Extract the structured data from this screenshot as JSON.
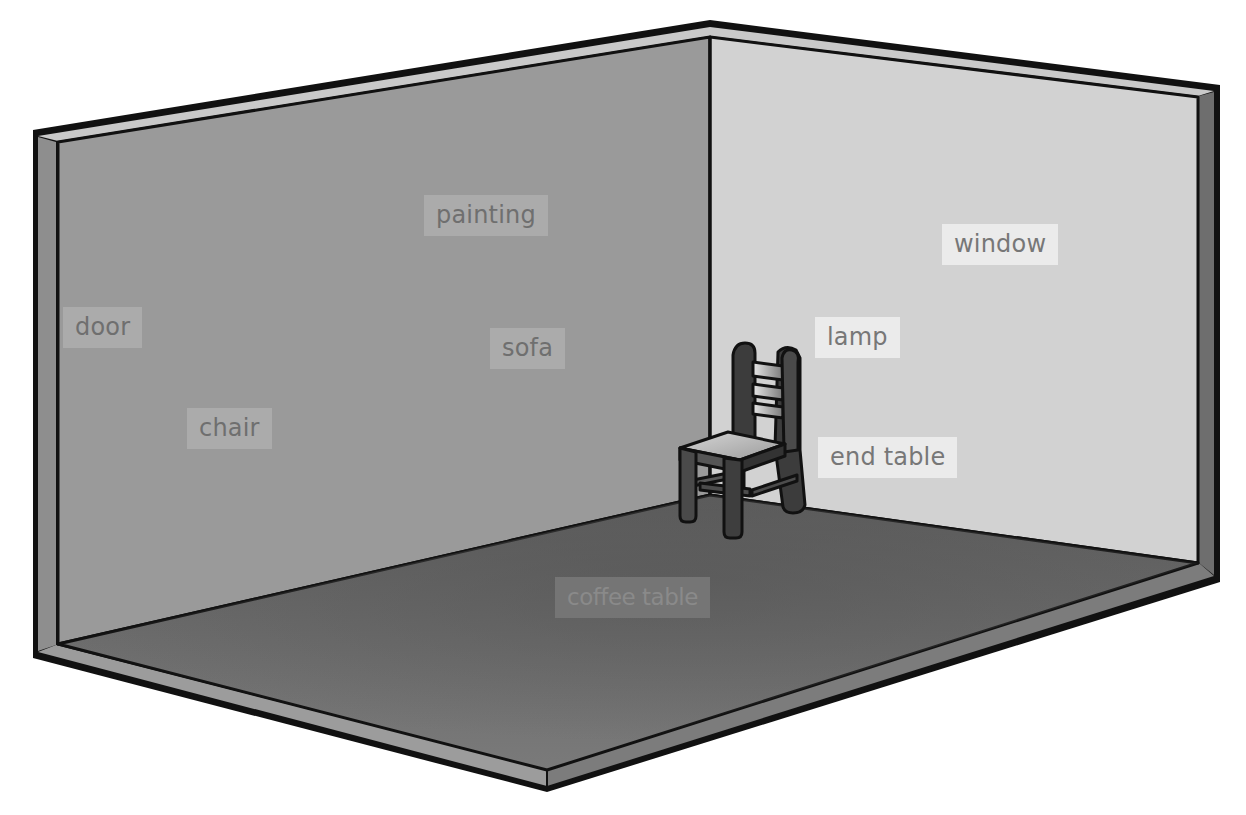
{
  "figure": {
    "colors": {
      "background": "#ffffff",
      "outline": "#111111",
      "left_wall": "#9a9a9a",
      "right_wall": "#d2d2d2",
      "floor": "#6a6a6a",
      "wall_edge_top": "#c9c9c9",
      "left_wall_edge": "#8e8e8e",
      "right_wall_edge": "#6e6e6e",
      "floor_edge_left": "#9c9c9c",
      "floor_edge_right": "#7c7c7c",
      "chair_dark": "#3c3c3c",
      "chair_light": "#bdbdbd"
    }
  },
  "labels": [
    {
      "id": "painting",
      "text": "painting",
      "surface": "left-wall",
      "x": 424,
      "y": 195
    },
    {
      "id": "window",
      "text": "window",
      "surface": "right-wall",
      "x": 942,
      "y": 224
    },
    {
      "id": "door",
      "text": "door",
      "surface": "left-wall",
      "x": 63,
      "y": 307
    },
    {
      "id": "lamp",
      "text": "lamp",
      "surface": "right-wall",
      "x": 815,
      "y": 317
    },
    {
      "id": "sofa",
      "text": "sofa",
      "surface": "left-wall",
      "x": 490,
      "y": 328
    },
    {
      "id": "chair",
      "text": "chair",
      "surface": "left-wall",
      "x": 187,
      "y": 408
    },
    {
      "id": "end-table",
      "text": "end table",
      "surface": "right-wall",
      "x": 818,
      "y": 437
    },
    {
      "id": "coffee-table",
      "text": "coffee table",
      "surface": "floor",
      "x": 555,
      "y": 577
    }
  ],
  "objects": [
    {
      "id": "chair",
      "name": "wooden ladder-back chair",
      "position": "back corner"
    }
  ]
}
